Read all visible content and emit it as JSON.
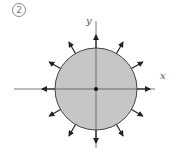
{
  "figure": {
    "number_label": "2",
    "x_axis_label": "x",
    "y_axis_label": "y"
  },
  "geometry": {
    "center": [
      96,
      89
    ],
    "radius": 41,
    "x_axis": [
      14,
      155
    ],
    "y_axis": [
      21,
      148
    ],
    "arrow_angles_deg": [
      0,
      30,
      60,
      90,
      120,
      150,
      180,
      210,
      240,
      270,
      300,
      330
    ],
    "arrow_length": 13
  },
  "colors": {
    "fill": "#c6c6c6",
    "stroke": "#444444",
    "axis": "#555555",
    "arrow": "#222222"
  }
}
